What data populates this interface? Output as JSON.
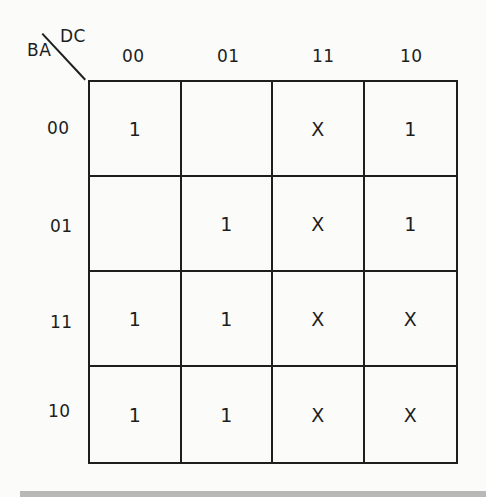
{
  "kmap": {
    "row_var": "BA",
    "col_var": "DC",
    "col_headers": [
      "00",
      "01",
      "11",
      "10"
    ],
    "row_headers": [
      "00",
      "01",
      "11",
      "10"
    ],
    "cells": [
      [
        "1",
        "",
        "X",
        "1"
      ],
      [
        "",
        "1",
        "X",
        "1"
      ],
      [
        "1",
        "1",
        "X",
        "X"
      ],
      [
        "1",
        "1",
        "X",
        "X"
      ]
    ]
  }
}
